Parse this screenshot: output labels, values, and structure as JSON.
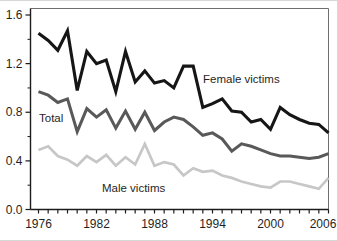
{
  "chart_data": {
    "type": "line",
    "title": "",
    "xlabel": "",
    "ylabel": "",
    "x": [
      1976,
      1977,
      1978,
      1979,
      1980,
      1981,
      1982,
      1983,
      1984,
      1985,
      1986,
      1987,
      1988,
      1989,
      1990,
      1991,
      1992,
      1993,
      1994,
      1995,
      1996,
      1997,
      1998,
      1999,
      2000,
      2001,
      2002,
      2003,
      2004,
      2005,
      2006
    ],
    "series": [
      {
        "name": "Male victims",
        "color": "#c7c7c7",
        "stroke_width": 2.7,
        "label_color": "#4a4a4a",
        "label_x": 102,
        "label_y": 191,
        "values": [
          0.49,
          0.52,
          0.44,
          0.41,
          0.36,
          0.44,
          0.39,
          0.45,
          0.36,
          0.43,
          0.37,
          0.54,
          0.36,
          0.39,
          0.37,
          0.28,
          0.34,
          0.31,
          0.32,
          0.28,
          0.26,
          0.23,
          0.21,
          0.19,
          0.18,
          0.23,
          0.23,
          0.21,
          0.19,
          0.17,
          0.26
        ]
      },
      {
        "name": "Total",
        "color": "#595959",
        "stroke_width": 3,
        "label_color": "#3d3d3d",
        "label_x": 39,
        "label_y": 121,
        "values": [
          0.97,
          0.94,
          0.88,
          0.91,
          0.64,
          0.83,
          0.76,
          0.82,
          0.67,
          0.81,
          0.66,
          0.8,
          0.65,
          0.72,
          0.76,
          0.74,
          0.68,
          0.61,
          0.63,
          0.58,
          0.48,
          0.54,
          0.52,
          0.49,
          0.46,
          0.44,
          0.44,
          0.43,
          0.42,
          0.43,
          0.46
        ]
      },
      {
        "name": "Female victims",
        "color": "#161616",
        "stroke_width": 3.1,
        "label_color": "#2b2b2b",
        "label_x": 203,
        "label_y": 82,
        "values": [
          1.45,
          1.39,
          1.31,
          1.47,
          0.98,
          1.3,
          1.2,
          1.23,
          0.97,
          1.3,
          1.05,
          1.14,
          1.04,
          1.06,
          1.0,
          1.18,
          1.18,
          0.84,
          0.87,
          0.91,
          0.81,
          0.8,
          0.72,
          0.74,
          0.66,
          0.84,
          0.78,
          0.74,
          0.71,
          0.7,
          0.63
        ]
      }
    ],
    "xlim": [
      1976,
      2006
    ],
    "ylim": [
      0.0,
      1.6
    ],
    "x_tick_every_year": true,
    "x_labeled_ticks": [
      1976,
      1982,
      1988,
      1994,
      2000,
      2006
    ],
    "x_labeled_tick_labels": [
      "1976",
      "1982",
      "1988",
      "1994",
      "2000",
      "2006"
    ],
    "y_major_ticks": [
      0.0,
      0.4,
      0.8,
      1.2,
      1.6
    ],
    "y_major_tick_labels": [
      "0.0",
      "0.4",
      "0.8",
      "1.2",
      "1.6"
    ],
    "y_minor_ticks": [
      0.2,
      0.6,
      1.0,
      1.4
    ],
    "grid": false,
    "legend_position": "inline-labels"
  },
  "colors": {
    "background": "#ffffff",
    "axis": "#1c1c1c",
    "frame_top_right": "#6e6e6e",
    "tick": "#1c1c1c",
    "axis_text": "#1f1f1f"
  }
}
